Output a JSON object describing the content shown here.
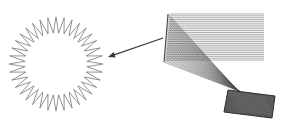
{
  "figure": {
    "background": "#ffffff",
    "starburst_ring": {
      "cx": 56,
      "cy": 64,
      "outer_radius": 47,
      "inner_radius": 31,
      "spikes": 36,
      "stroke": "#7a7a7a",
      "stroke_width": 0.8
    },
    "arrow": {
      "x1": 163,
      "y1": 38,
      "x2": 108,
      "y2": 57,
      "stroke": "#3a3a3a",
      "stroke_width": 1.2
    },
    "ray_fan": {
      "apex_x": 168,
      "apex_y": 14,
      "horizontal": {
        "x_start": 170,
        "x_end": 264,
        "y_top": 14,
        "y_bottom": 60,
        "count": 26,
        "stroke": "#8a8a8a"
      },
      "diagonals": {
        "count": 30,
        "left_x_top": 168,
        "left_y_top": 14,
        "left_x_bottom": 164,
        "left_y_bottom": 62,
        "focus_x": 238,
        "focus_y": 90,
        "end_x": 256,
        "end_y": 112,
        "stroke": "#4a4a4a"
      }
    },
    "tilted_block": {
      "points": [
        [
          228,
          90
        ],
        [
          275,
          96
        ],
        [
          272,
          118
        ],
        [
          224,
          112
        ]
      ],
      "fill": "#5a5a5a",
      "stroke": "#2e2e2e"
    }
  }
}
